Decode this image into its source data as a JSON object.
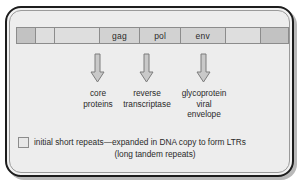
{
  "figure": {
    "background_color": "#ededed",
    "frame_color": "#1d1d1d"
  },
  "genome_bar": {
    "name": "retrovirus-genome-bar",
    "segments": [
      {
        "label": "",
        "kind": "ltr-repeat",
        "width_pct": 7.0,
        "color": "#c2c2c2"
      },
      {
        "label": "",
        "kind": "spacer",
        "width_pct": 7.0,
        "color": "#dedede"
      },
      {
        "label": "",
        "kind": "spacer",
        "width_pct": 16.5,
        "color": "#dedede"
      },
      {
        "label": "gag",
        "kind": "gene",
        "width_pct": 15.0,
        "color": "#d2d2d2"
      },
      {
        "label": "pol",
        "kind": "gene",
        "width_pct": 15.0,
        "color": "#d2d2d2"
      },
      {
        "label": "env",
        "kind": "gene",
        "width_pct": 16.5,
        "color": "#d2d2d2"
      },
      {
        "label": "",
        "kind": "spacer",
        "width_pct": 13.0,
        "color": "#dedede"
      },
      {
        "label": "",
        "kind": "ltr-repeat",
        "width_pct": 10.0,
        "color": "#c2c2c2"
      }
    ]
  },
  "arrows": [
    {
      "name": "arrow-gag",
      "left": 90,
      "top": 53
    },
    {
      "name": "arrow-pol",
      "left": 139,
      "top": 53
    },
    {
      "name": "arrow-env",
      "left": 196,
      "top": 53
    }
  ],
  "products": [
    {
      "name": "product-gag",
      "left": 62,
      "top": 88,
      "width": 72,
      "lines": [
        "core",
        "proteins"
      ]
    },
    {
      "name": "product-pol",
      "left": 111,
      "top": 88,
      "width": 72,
      "lines": [
        "reverse",
        "transcriptase"
      ]
    },
    {
      "name": "product-env",
      "left": 168,
      "top": 88,
      "width": 72,
      "lines": [
        "glycoprotein",
        "viral",
        "envelope"
      ]
    }
  ],
  "legend": {
    "name": "ltr-legend",
    "swatch_color": "#e8e8e8",
    "line1": "initial short repeats—expanded in DNA copy to form LTRs",
    "line2": "(long tandem repeats)"
  }
}
